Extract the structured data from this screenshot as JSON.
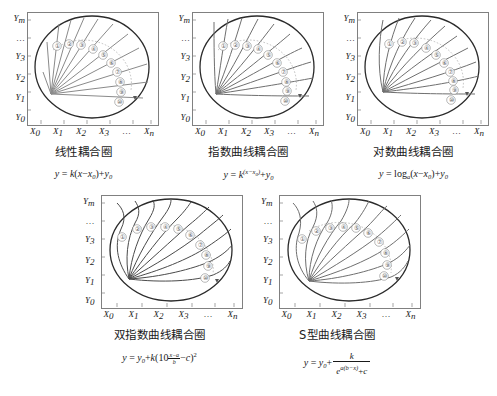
{
  "figure": {
    "axis": {
      "y_labels": [
        "Y_m",
        "…",
        "Y_3",
        "Y_2",
        "Y_1",
        "Y_0"
      ],
      "y_label_base": [
        "Y",
        "…",
        "Y",
        "Y",
        "Y",
        "Y"
      ],
      "y_label_sub": [
        "m",
        "",
        "3",
        "2",
        "1",
        "0"
      ],
      "x_label_base": [
        "X",
        "X",
        "X",
        "X",
        "…",
        "X"
      ],
      "x_label_sub": [
        "0",
        "1",
        "2",
        "3",
        "",
        "n"
      ]
    },
    "marker_labels": [
      "①",
      "②",
      "③",
      "④",
      "⑤",
      "⑥",
      "⑦",
      "⑧",
      "⑨",
      "⑩"
    ],
    "colors": {
      "curve": "#8a8a8a",
      "curve_dark": "#5a5a5a",
      "circle": "#2b2b2b",
      "box": "#808080",
      "dotted_arc": "#b0b0b0",
      "text": "#1a1a1a"
    },
    "panels": [
      {
        "id": "linear",
        "title": "线性耦合圈",
        "formula_plain": "y = k(x−x0)+y0",
        "formula": {
          "lhs": "y",
          "eq": "=",
          "k": "k",
          "open": "(",
          "x": "x",
          "minus": "−",
          "x0_base": "x",
          "x0_sub": "0",
          "close": ")",
          "plus": "+",
          "y0_base": "y",
          "y0_sub": "0"
        },
        "curve_type": "linear"
      },
      {
        "id": "exponential",
        "title": "指数曲线耦合圈",
        "formula_plain": "y = k^(x−x0)+y0",
        "formula": {
          "lhs": "y",
          "eq": "=",
          "k": "k",
          "exp": "(x−x",
          "exp_sub": "0",
          "exp_close": ")",
          "plus": "+",
          "y0_base": "y",
          "y0_sub": "0"
        },
        "curve_type": "exp"
      },
      {
        "id": "logarithmic",
        "title": "对数曲线耦合圈",
        "formula_plain": "y = log_a(x−x0)+y0",
        "formula": {
          "lhs": "y",
          "eq": "=",
          "log": "log",
          "base": "a",
          "open": "(",
          "x": "x",
          "minus": "−",
          "x0_base": "x",
          "x0_sub": "0",
          "close": ")",
          "plus": "+",
          "y0_base": "y",
          "y0_sub": "0"
        },
        "curve_type": "log"
      },
      {
        "id": "double-exponential",
        "title": "双指数曲线耦合圈",
        "formula_plain": "y = y0+k(10^((x−a)/b) −c)²",
        "formula": {
          "lhs": "y",
          "eq": "=",
          "y0_base": "y",
          "y0_sub": "0",
          "plus": "+",
          "k": "k",
          "open": "(",
          "ten": "10",
          "frac_num": "x−a",
          "frac_den": "b",
          "minus": "−",
          "c": "c",
          "close": ")",
          "sq": "2"
        },
        "curve_type": "dblexp"
      },
      {
        "id": "s-curve",
        "title": "S型曲线耦合圈",
        "formula_plain": "y = y0+ k / (e^(a(b−x))+c)",
        "formula": {
          "lhs": "y",
          "eq": "=",
          "y0_base": "y",
          "y0_sub": "0",
          "plus": "+",
          "num": "k",
          "den_e": "e",
          "den_exp": "a(b−x)",
          "den_plus": "+",
          "den_c": "c"
        },
        "curve_type": "sigmoid"
      }
    ]
  }
}
